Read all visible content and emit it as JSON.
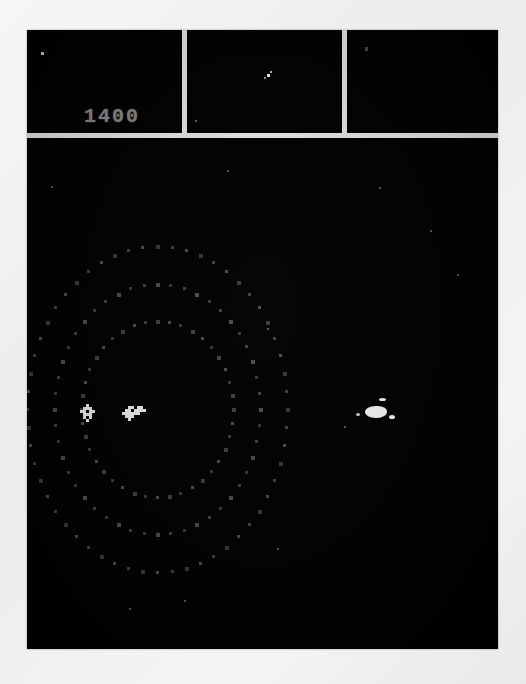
{
  "game": {
    "title": "Atari 2600 Cosmic Ark",
    "screen": {
      "background_color": "#010101",
      "bezel_color": "#f2f2f2",
      "divider_color": "#f0f0f0"
    },
    "score": {
      "label": "score",
      "value": "1400",
      "color": "#8d8d8d"
    },
    "status_panels": [
      {
        "name": "left-panel",
        "contents": "single-pixel-marker",
        "score_shown": "1400"
      },
      {
        "name": "center-panel",
        "contents": "ship-cluster-marker"
      },
      {
        "name": "right-panel",
        "contents": "empty"
      }
    ],
    "panel_sprites": [
      {
        "panel": "left",
        "x": 14,
        "y": 22,
        "w": 3,
        "h": 3,
        "color": "#c8c8c8"
      },
      {
        "panel": "center",
        "x": 80,
        "y": 44,
        "w": 3,
        "h": 3,
        "color": "#ffffff"
      },
      {
        "panel": "center",
        "x": 83,
        "y": 41,
        "w": 2,
        "h": 2,
        "color": "#bdbdbd"
      },
      {
        "panel": "center",
        "x": 77,
        "y": 47,
        "w": 2,
        "h": 2,
        "color": "#9a9a9a"
      },
      {
        "panel": "center",
        "x": 8,
        "y": 90,
        "w": 2,
        "h": 2,
        "color": "#6a6a6a"
      },
      {
        "panel": "right",
        "x": 18,
        "y": 17,
        "w": 3,
        "h": 4,
        "color": "#4a4a4a"
      }
    ],
    "playfield": {
      "ring_center": {
        "x": 129,
        "y": 270
      },
      "ring_dot_color": "#4a4a4a",
      "rings": [
        {
          "name": "inner-ring",
          "radius_x": 76,
          "radius_y": 88,
          "dot_count": 40
        },
        {
          "name": "middle-ring",
          "radius_x": 103,
          "radius_y": 125,
          "dot_count": 48
        },
        {
          "name": "outer-ring",
          "radius_x": 130,
          "radius_y": 163,
          "dot_count": 56
        }
      ],
      "player_ship": {
        "x": 53,
        "y": 266,
        "color": "#f2f2f2",
        "name": "player-ship-sprite"
      },
      "enemy_ship": {
        "x": 95,
        "y": 268,
        "color": "#f2f2f2",
        "name": "enemy-ship-sprite"
      },
      "explosion": {
        "x": 338,
        "y": 268,
        "width": 22,
        "height": 12,
        "color": "#ffffff",
        "name": "explosion-blob"
      },
      "stars": [
        {
          "x": 24,
          "y": 48
        },
        {
          "x": 352,
          "y": 49
        },
        {
          "x": 403,
          "y": 92
        },
        {
          "x": 200,
          "y": 32
        },
        {
          "x": 430,
          "y": 136
        },
        {
          "x": 240,
          "y": 190
        },
        {
          "x": 250,
          "y": 410
        },
        {
          "x": 317,
          "y": 288
        },
        {
          "x": 157,
          "y": 462
        },
        {
          "x": 102,
          "y": 470
        }
      ]
    }
  }
}
